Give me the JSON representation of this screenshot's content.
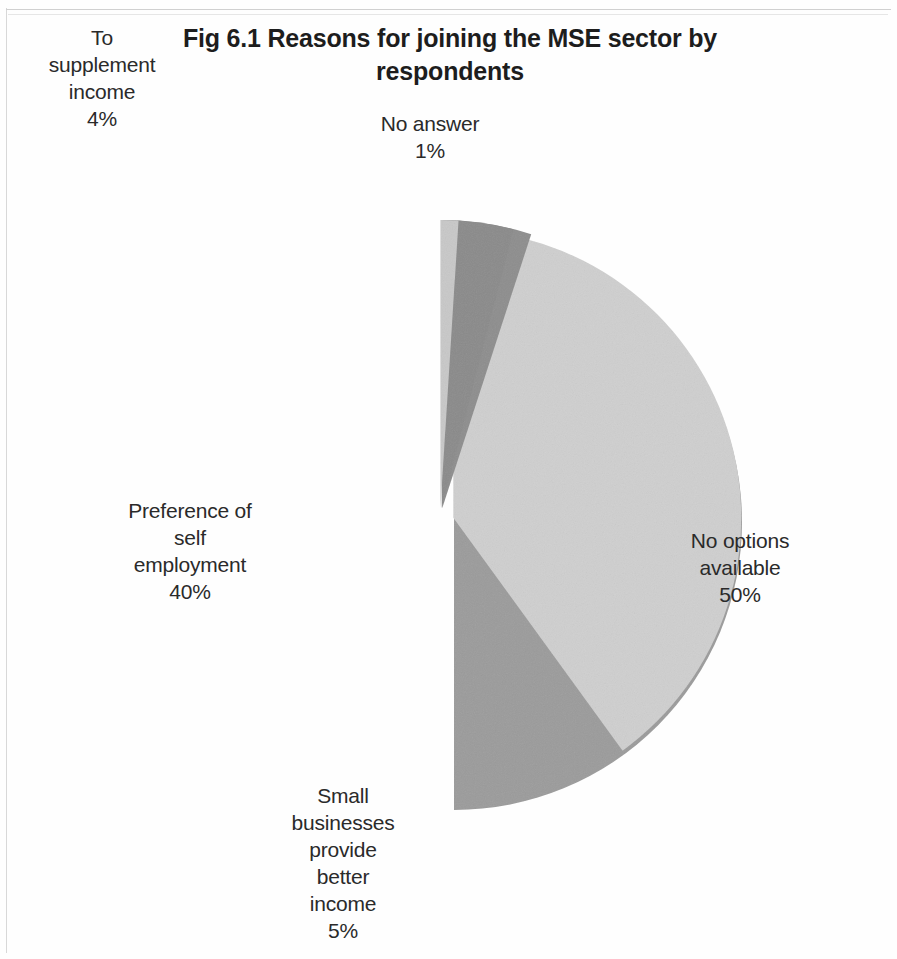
{
  "chart_title": "Fig 6.1 Reasons for joining the MSE sector by respondents",
  "chart_title_line1": "Fig 6.1 Reasons for joining the MSE sector by",
  "chart_title_line2": "respondents",
  "labels": {
    "supplement": {
      "l1": "To",
      "l2": "supplement",
      "l3": "income",
      "l4": "4%"
    },
    "no_answer": {
      "l1": "No answer",
      "l2": "1%"
    },
    "preference": {
      "l1": "Preference of",
      "l2": "self",
      "l3": "employment",
      "l4": "40%"
    },
    "no_options": {
      "l1": "No options",
      "l2": "available",
      "l3": "50%"
    },
    "small_business": {
      "l1": "Small",
      "l2": "businesses",
      "l3": "provide",
      "l4": "better",
      "l5": "income",
      "l6": "5%"
    }
  },
  "chart_data": {
    "type": "pie",
    "title": "Fig 6.1 Reasons for joining the MSE sector by respondents",
    "xlabel": "",
    "ylabel": "",
    "exploded": true,
    "legend": "none",
    "labels_position": "outside-and-inside-slices",
    "categories": [
      "No options available",
      "Preference of self employment",
      "Small businesses provide better income",
      "To supplement income",
      "No answer"
    ],
    "values": [
      50,
      40,
      5,
      4,
      1
    ],
    "value_labels": [
      "50%",
      "40%",
      "5%",
      "4%",
      "1%"
    ],
    "colors": [
      "#9b9b9b",
      "#cfcfcf",
      "#8d8d8d",
      "#8a8a8a",
      "#c8c8c8"
    ],
    "total": 100,
    "units": "percent"
  },
  "geometry": {
    "center_x": 440,
    "center_y": 522,
    "radius": 288,
    "explode_offset": 14,
    "start_angle_deg": -90
  }
}
